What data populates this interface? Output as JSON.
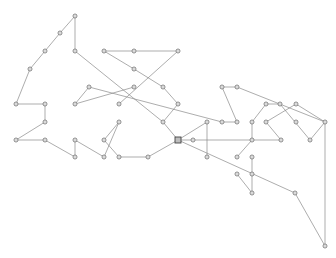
{
  "diagram": {
    "type": "graph",
    "width": 336,
    "height": 258,
    "background": "#ffffff",
    "edge_color": "#8a8a8a",
    "node_color": "#6a6a6a",
    "nodes": [
      {
        "id": "n1",
        "x": 75,
        "y": 16,
        "shape": "circle"
      },
      {
        "id": "n2",
        "x": 60,
        "y": 33,
        "shape": "circle"
      },
      {
        "id": "n3",
        "x": 45,
        "y": 51,
        "shape": "circle"
      },
      {
        "id": "n4",
        "x": 30,
        "y": 69,
        "shape": "circle"
      },
      {
        "id": "n5",
        "x": 75,
        "y": 51,
        "shape": "circle"
      },
      {
        "id": "n6",
        "x": 16,
        "y": 104,
        "shape": "circle"
      },
      {
        "id": "n7",
        "x": 45,
        "y": 104,
        "shape": "circle"
      },
      {
        "id": "n8",
        "x": 45,
        "y": 122,
        "shape": "circle"
      },
      {
        "id": "n9",
        "x": 16,
        "y": 140,
        "shape": "circle"
      },
      {
        "id": "n10",
        "x": 45,
        "y": 140,
        "shape": "circle"
      },
      {
        "id": "n11",
        "x": 75,
        "y": 140,
        "shape": "circle"
      },
      {
        "id": "n12",
        "x": 75,
        "y": 157,
        "shape": "circle"
      },
      {
        "id": "n13",
        "x": 104,
        "y": 51,
        "shape": "circle"
      },
      {
        "id": "n14",
        "x": 134,
        "y": 51,
        "shape": "circle"
      },
      {
        "id": "n15",
        "x": 178,
        "y": 51,
        "shape": "circle"
      },
      {
        "id": "n16",
        "x": 134,
        "y": 69,
        "shape": "circle"
      },
      {
        "id": "n17",
        "x": 163,
        "y": 87,
        "shape": "circle"
      },
      {
        "id": "n18",
        "x": 89,
        "y": 87,
        "shape": "circle"
      },
      {
        "id": "n19",
        "x": 134,
        "y": 87,
        "shape": "circle"
      },
      {
        "id": "n20",
        "x": 75,
        "y": 104,
        "shape": "circle"
      },
      {
        "id": "n21",
        "x": 119,
        "y": 104,
        "shape": "circle"
      },
      {
        "id": "n22",
        "x": 178,
        "y": 104,
        "shape": "circle"
      },
      {
        "id": "n23",
        "x": 163,
        "y": 122,
        "shape": "circle"
      },
      {
        "id": "n24",
        "x": 119,
        "y": 122,
        "shape": "circle"
      },
      {
        "id": "n25",
        "x": 104,
        "y": 140,
        "shape": "circle"
      },
      {
        "id": "n26",
        "x": 104,
        "y": 157,
        "shape": "circle"
      },
      {
        "id": "n27",
        "x": 119,
        "y": 157,
        "shape": "circle"
      },
      {
        "id": "n28",
        "x": 148,
        "y": 157,
        "shape": "circle"
      },
      {
        "id": "n29",
        "x": 178,
        "y": 140,
        "shape": "square"
      },
      {
        "id": "n30",
        "x": 193,
        "y": 140,
        "shape": "circle"
      },
      {
        "id": "n31",
        "x": 207,
        "y": 122,
        "shape": "circle"
      },
      {
        "id": "n32",
        "x": 207,
        "y": 157,
        "shape": "circle"
      },
      {
        "id": "n33",
        "x": 222,
        "y": 87,
        "shape": "circle"
      },
      {
        "id": "n34",
        "x": 237,
        "y": 87,
        "shape": "circle"
      },
      {
        "id": "n35",
        "x": 222,
        "y": 122,
        "shape": "circle"
      },
      {
        "id": "n36",
        "x": 237,
        "y": 122,
        "shape": "circle"
      },
      {
        "id": "n37",
        "x": 252,
        "y": 122,
        "shape": "circle"
      },
      {
        "id": "n38",
        "x": 252,
        "y": 140,
        "shape": "circle"
      },
      {
        "id": "n39",
        "x": 281,
        "y": 140,
        "shape": "circle"
      },
      {
        "id": "n40",
        "x": 266,
        "y": 104,
        "shape": "circle"
      },
      {
        "id": "n41",
        "x": 280,
        "y": 104,
        "shape": "circle"
      },
      {
        "id": "n42",
        "x": 296,
        "y": 104,
        "shape": "circle"
      },
      {
        "id": "n43",
        "x": 266,
        "y": 122,
        "shape": "circle"
      },
      {
        "id": "n44",
        "x": 296,
        "y": 122,
        "shape": "circle"
      },
      {
        "id": "n45",
        "x": 325,
        "y": 122,
        "shape": "circle"
      },
      {
        "id": "n46",
        "x": 310,
        "y": 140,
        "shape": "circle"
      },
      {
        "id": "n47",
        "x": 237,
        "y": 157,
        "shape": "circle"
      },
      {
        "id": "n48",
        "x": 252,
        "y": 157,
        "shape": "circle"
      },
      {
        "id": "n49",
        "x": 237,
        "y": 174,
        "shape": "circle"
      },
      {
        "id": "n50",
        "x": 252,
        "y": 174,
        "shape": "circle"
      },
      {
        "id": "n51",
        "x": 252,
        "y": 193,
        "shape": "circle"
      },
      {
        "id": "n52",
        "x": 295,
        "y": 193,
        "shape": "circle"
      },
      {
        "id": "n53",
        "x": 325,
        "y": 246,
        "shape": "circle"
      }
    ],
    "edges": [
      [
        "n1",
        "n2"
      ],
      [
        "n2",
        "n3"
      ],
      [
        "n3",
        "n4"
      ],
      [
        "n4",
        "n6"
      ],
      [
        "n1",
        "n5"
      ],
      [
        "n6",
        "n7"
      ],
      [
        "n7",
        "n8"
      ],
      [
        "n8",
        "n9"
      ],
      [
        "n9",
        "n10"
      ],
      [
        "n10",
        "n12"
      ],
      [
        "n11",
        "n12"
      ],
      [
        "n11",
        "n26"
      ],
      [
        "n5",
        "n23"
      ],
      [
        "n13",
        "n14"
      ],
      [
        "n14",
        "n15"
      ],
      [
        "n13",
        "n16"
      ],
      [
        "n16",
        "n17"
      ],
      [
        "n17",
        "n22"
      ],
      [
        "n15",
        "n21"
      ],
      [
        "n18",
        "n20"
      ],
      [
        "n20",
        "n19"
      ],
      [
        "n18",
        "n35"
      ],
      [
        "n22",
        "n23"
      ],
      [
        "n23",
        "n29"
      ],
      [
        "n24",
        "n25"
      ],
      [
        "n24",
        "n26"
      ],
      [
        "n25",
        "n27"
      ],
      [
        "n27",
        "n28"
      ],
      [
        "n28",
        "n29"
      ],
      [
        "n29",
        "n30"
      ],
      [
        "n30",
        "n38"
      ],
      [
        "n29",
        "n52"
      ],
      [
        "n52",
        "n53"
      ],
      [
        "n31",
        "n32"
      ],
      [
        "n31",
        "n29"
      ],
      [
        "n33",
        "n34"
      ],
      [
        "n33",
        "n36"
      ],
      [
        "n35",
        "n36"
      ],
      [
        "n34",
        "n45"
      ],
      [
        "n37",
        "n40"
      ],
      [
        "n40",
        "n41"
      ],
      [
        "n41",
        "n46"
      ],
      [
        "n37",
        "n38"
      ],
      [
        "n42",
        "n43"
      ],
      [
        "n42",
        "n45"
      ],
      [
        "n43",
        "n39"
      ],
      [
        "n45",
        "n46"
      ],
      [
        "n45",
        "n53"
      ],
      [
        "n38",
        "n39"
      ],
      [
        "n38",
        "n47"
      ],
      [
        "n48",
        "n51"
      ],
      [
        "n49",
        "n51"
      ]
    ]
  }
}
